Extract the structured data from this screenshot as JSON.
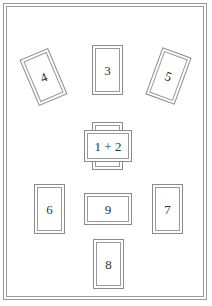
{
  "frame": {
    "border_color": "#9a9a9a"
  },
  "cards": [
    {
      "id": "card-4",
      "label": "4",
      "orientation": "vertical",
      "rotation_deg": -23
    },
    {
      "id": "card-3",
      "label": "3",
      "orientation": "vertical",
      "rotation_deg": 0
    },
    {
      "id": "card-5",
      "label": "5",
      "orientation": "vertical",
      "rotation_deg": 20
    },
    {
      "id": "card-1-2",
      "label": "1 + 2",
      "orientation": "crossed",
      "rotation_deg": 0
    },
    {
      "id": "card-6",
      "label": "6",
      "orientation": "vertical",
      "rotation_deg": 0
    },
    {
      "id": "card-9",
      "label": "9",
      "orientation": "horizontal",
      "rotation_deg": 0
    },
    {
      "id": "card-7",
      "label": "7",
      "orientation": "vertical",
      "rotation_deg": 0
    },
    {
      "id": "card-8",
      "label": "8",
      "orientation": "vertical",
      "rotation_deg": 0
    }
  ]
}
